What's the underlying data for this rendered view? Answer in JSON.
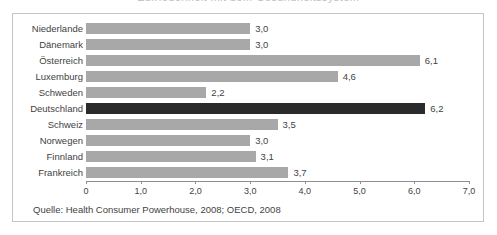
{
  "chart_data": {
    "type": "bar",
    "orientation": "horizontal",
    "title": "Zufriedenheit mit dem Gesundheitssystem",
    "categories": [
      "Niederlande",
      "Dänemark",
      "Österreich",
      "Luxemburg",
      "Schweden",
      "Deutschland",
      "Schweiz",
      "Norwegen",
      "Finnland",
      "Frankreich"
    ],
    "values": [
      3.0,
      3.0,
      6.1,
      4.6,
      2.2,
      6.2,
      3.5,
      3.0,
      3.1,
      3.7
    ],
    "value_labels": [
      "3,0",
      "3,0",
      "6,1",
      "4,6",
      "2,2",
      "6,2",
      "3,5",
      "3,0",
      "3,1",
      "3,7"
    ],
    "highlight_index": 5,
    "bar_color": "#a8a8a8",
    "highlight_color": "#2b2b2b",
    "xlabel": "",
    "ylabel": "",
    "xlim": [
      0,
      7
    ],
    "xticks": [
      0,
      1,
      2,
      3,
      4,
      5,
      6,
      7
    ],
    "xtick_labels": [
      "0",
      "1,0",
      "2,0",
      "3,0",
      "4,0",
      "5,0",
      "6,0",
      "7,0"
    ],
    "grid": false,
    "legend": false
  },
  "source": {
    "text": "Quelle: Health Consumer Powerhouse, 2008; OECD, 2008"
  }
}
